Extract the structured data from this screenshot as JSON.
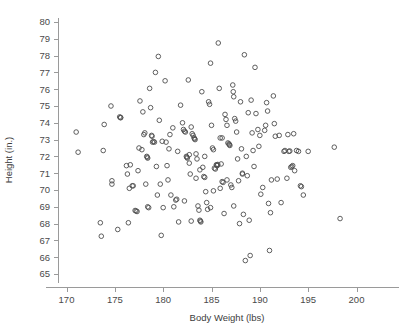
{
  "chart_data": {
    "type": "scatter",
    "title": "",
    "xlabel": "Body Weight (lbs)",
    "ylabel": "Height (in.)",
    "xlim": [
      168.2,
      201.5
    ],
    "ylim": [
      64.2,
      80.6
    ],
    "xticks": [
      170,
      175,
      180,
      185,
      190,
      195,
      200
    ],
    "yticks": [
      65,
      66,
      67,
      68,
      69,
      70,
      71,
      72,
      73,
      74,
      75,
      76,
      77,
      78,
      79,
      80
    ],
    "xtick_labels": [
      "170",
      "175",
      "180",
      "185",
      "190",
      "195",
      "200"
    ],
    "ytick_labels": [
      "65",
      "66",
      "67",
      "68",
      "69",
      "70",
      "71",
      "72",
      "73",
      "74",
      "75",
      "76",
      "77",
      "78",
      "79",
      "80"
    ],
    "grid": false,
    "legend": null,
    "marker": "open-circle",
    "marker_color": "#4d4d4d",
    "n_points": 201,
    "points": [
      [
        171.0,
        73.45
      ],
      [
        171.2,
        72.25
      ],
      [
        173.5,
        68.05
      ],
      [
        173.6,
        67.25
      ],
      [
        173.8,
        72.35
      ],
      [
        173.9,
        73.9
      ],
      [
        174.6,
        75.0
      ],
      [
        174.7,
        70.55
      ],
      [
        174.7,
        70.35
      ],
      [
        175.3,
        67.65
      ],
      [
        175.5,
        74.35
      ],
      [
        175.6,
        74.32
      ],
      [
        175.6,
        74.3
      ],
      [
        176.2,
        71.45
      ],
      [
        176.3,
        70.95
      ],
      [
        176.4,
        68.05
      ],
      [
        176.5,
        70.1
      ],
      [
        176.8,
        70.25
      ],
      [
        176.9,
        70.25
      ],
      [
        177.1,
        68.78
      ],
      [
        177.2,
        68.75
      ],
      [
        177.3,
        68.72
      ],
      [
        177.4,
        71.15
      ],
      [
        177.5,
        72.5
      ],
      [
        177.6,
        75.3
      ],
      [
        177.9,
        74.65
      ],
      [
        178.0,
        73.3
      ],
      [
        178.1,
        73.4
      ],
      [
        178.2,
        70.35
      ],
      [
        178.3,
        72.0
      ],
      [
        178.35,
        71.95
      ],
      [
        178.4,
        71.9
      ],
      [
        178.5,
        68.95
      ],
      [
        178.6,
        76.05
      ],
      [
        178.7,
        74.9
      ],
      [
        178.8,
        73.25
      ],
      [
        178.85,
        73.2
      ],
      [
        178.9,
        72.85
      ],
      [
        179.0,
        72.88
      ],
      [
        179.1,
        72.85
      ],
      [
        179.2,
        77.0
      ],
      [
        179.3,
        71.4
      ],
      [
        179.4,
        69.7
      ],
      [
        179.5,
        77.95
      ],
      [
        179.6,
        74.15
      ],
      [
        179.8,
        67.3
      ],
      [
        180.0,
        68.95
      ],
      [
        180.2,
        76.5
      ],
      [
        180.3,
        72.85
      ],
      [
        180.5,
        70.6
      ],
      [
        180.6,
        72.45
      ],
      [
        180.8,
        69.7
      ],
      [
        181.0,
        73.7
      ],
      [
        181.1,
        69.0
      ],
      [
        181.3,
        69.4
      ],
      [
        181.4,
        69.45
      ],
      [
        181.6,
        68.1
      ],
      [
        181.8,
        75.05
      ],
      [
        182.0,
        74.0
      ],
      [
        182.1,
        73.6
      ],
      [
        182.2,
        73.5
      ],
      [
        182.3,
        73.45
      ],
      [
        182.4,
        72.0
      ],
      [
        182.45,
        71.95
      ],
      [
        182.5,
        71.9
      ],
      [
        182.6,
        76.55
      ],
      [
        182.7,
        71.6
      ],
      [
        182.8,
        70.95
      ],
      [
        182.9,
        73.75
      ],
      [
        183.0,
        73.35
      ],
      [
        183.1,
        73.25
      ],
      [
        183.2,
        73.1
      ],
      [
        183.25,
        73.05
      ],
      [
        183.3,
        73.0
      ],
      [
        183.4,
        72.15
      ],
      [
        183.5,
        71.85
      ],
      [
        183.6,
        69.05
      ],
      [
        183.7,
        68.8
      ],
      [
        183.8,
        68.2
      ],
      [
        183.85,
        68.15
      ],
      [
        183.9,
        68.1
      ],
      [
        184.0,
        75.85
      ],
      [
        184.1,
        71.35
      ],
      [
        184.2,
        70.8
      ],
      [
        184.3,
        70.75
      ],
      [
        184.4,
        69.9
      ],
      [
        184.5,
        69.25
      ],
      [
        184.6,
        68.85
      ],
      [
        184.7,
        75.25
      ],
      [
        184.8,
        75.1
      ],
      [
        184.9,
        77.55
      ],
      [
        185.0,
        73.85
      ],
      [
        185.1,
        72.5
      ],
      [
        185.2,
        72.4
      ],
      [
        185.3,
        71.3
      ],
      [
        185.4,
        71.25
      ],
      [
        185.5,
        71.5
      ],
      [
        185.55,
        71.48
      ],
      [
        185.6,
        71.45
      ],
      [
        185.65,
        71.52
      ],
      [
        185.7,
        78.75
      ],
      [
        185.8,
        76.05
      ],
      [
        185.9,
        73.1
      ],
      [
        186.0,
        71.55
      ],
      [
        186.1,
        70.5
      ],
      [
        186.2,
        70.45
      ],
      [
        186.3,
        68.6
      ],
      [
        186.4,
        74.5
      ],
      [
        186.5,
        74.2
      ],
      [
        186.6,
        73.85
      ],
      [
        186.7,
        72.8
      ],
      [
        186.8,
        72.75
      ],
      [
        186.85,
        72.7
      ],
      [
        186.9,
        72.65
      ],
      [
        187.0,
        70.3
      ],
      [
        187.1,
        70.15
      ],
      [
        187.2,
        76.25
      ],
      [
        187.25,
        75.85
      ],
      [
        187.3,
        75.55
      ],
      [
        187.4,
        74.25
      ],
      [
        187.5,
        74.1
      ],
      [
        187.6,
        73.45
      ],
      [
        187.7,
        71.85
      ],
      [
        187.8,
        70.55
      ],
      [
        187.9,
        68.0
      ],
      [
        188.0,
        75.25
      ],
      [
        188.1,
        72.45
      ],
      [
        188.2,
        70.95
      ],
      [
        188.3,
        68.55
      ],
      [
        188.4,
        78.05
      ],
      [
        188.5,
        65.8
      ],
      [
        188.6,
        72.0
      ],
      [
        188.7,
        70.85
      ],
      [
        188.8,
        74.6
      ],
      [
        188.9,
        68.2
      ],
      [
        189.0,
        66.1
      ],
      [
        189.1,
        75.35
      ],
      [
        189.2,
        73.4
      ],
      [
        189.3,
        72.35
      ],
      [
        189.4,
        71.4
      ],
      [
        189.5,
        77.3
      ],
      [
        189.6,
        74.55
      ],
      [
        189.8,
        73.6
      ],
      [
        190.0,
        73.25
      ],
      [
        190.1,
        69.75
      ],
      [
        190.3,
        70.15
      ],
      [
        190.5,
        73.55
      ],
      [
        190.6,
        73.85
      ],
      [
        190.7,
        75.2
      ],
      [
        190.8,
        74.7
      ],
      [
        190.9,
        69.2
      ],
      [
        191.0,
        66.4
      ],
      [
        191.1,
        68.65
      ],
      [
        191.2,
        70.6
      ],
      [
        191.4,
        75.6
      ],
      [
        191.5,
        73.95
      ],
      [
        191.6,
        73.2
      ],
      [
        192.0,
        73.25
      ],
      [
        192.2,
        69.25
      ],
      [
        192.5,
        72.3
      ],
      [
        192.6,
        72.35
      ],
      [
        192.8,
        70.7
      ],
      [
        193.0,
        72.3
      ],
      [
        193.1,
        72.32
      ],
      [
        193.2,
        71.35
      ],
      [
        193.3,
        71.4
      ],
      [
        193.4,
        71.45
      ],
      [
        193.5,
        73.35
      ],
      [
        193.6,
        71.15
      ],
      [
        193.8,
        72.35
      ],
      [
        194.0,
        72.3
      ],
      [
        194.2,
        70.25
      ],
      [
        194.3,
        70.2
      ],
      [
        194.5,
        69.7
      ],
      [
        195.0,
        72.3
      ],
      [
        197.7,
        72.55
      ],
      [
        198.3,
        68.3
      ],
      [
        180.7,
        73.3
      ],
      [
        181.5,
        72.3
      ],
      [
        182.2,
        69.35
      ],
      [
        183.4,
        70.7
      ],
      [
        184.3,
        72.0
      ],
      [
        185.2,
        69.95
      ],
      [
        186.1,
        73.1
      ],
      [
        179.9,
        72.9
      ],
      [
        177.8,
        72.4
      ],
      [
        176.6,
        71.5
      ],
      [
        182.9,
        68.15
      ],
      [
        184.9,
        68.95
      ],
      [
        187.3,
        69.05
      ],
      [
        188.2,
        71.0
      ],
      [
        189.9,
        72.6
      ],
      [
        191.8,
        70.65
      ],
      [
        192.9,
        73.3
      ],
      [
        185.9,
        70.1
      ],
      [
        186.6,
        70.6
      ],
      [
        183.8,
        71.2
      ],
      [
        180.4,
        71.45
      ],
      [
        178.4,
        69.0
      ],
      [
        179.7,
        70.35
      ],
      [
        182.7,
        72.1
      ]
    ]
  },
  "axis": {
    "x_title": "Body Weight (lbs)",
    "y_title": "Height (in.)"
  },
  "colors": {
    "axis": "#9a9a9a",
    "marker_stroke": "#4d4d4d",
    "text": "#3c3c3c",
    "background": "#ffffff"
  }
}
